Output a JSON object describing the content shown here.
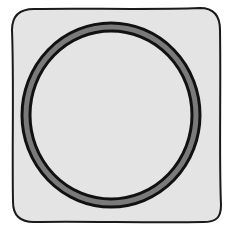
{
  "icon": {
    "name": "circle-in-square",
    "shape": "ring",
    "colors": {
      "background": "#ffffff",
      "square_fill": "#e4e4e4",
      "square_stroke": "#1a1a1a",
      "ring_fill": "#7a7a7a",
      "ring_outline": "#111111"
    }
  }
}
